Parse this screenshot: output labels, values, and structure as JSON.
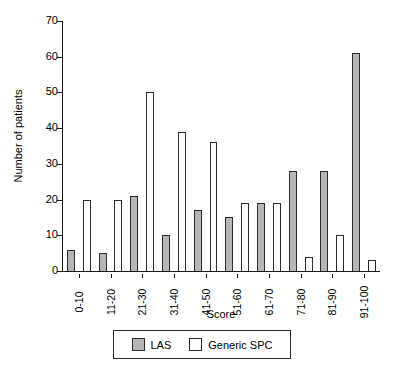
{
  "chart_data": {
    "type": "bar",
    "title": "",
    "xlabel": "Score",
    "ylabel": "Number of patients",
    "categories": [
      "0-10",
      "11-20",
      "21-30",
      "31-40",
      "41-50",
      "51-60",
      "61-70",
      "71-80",
      "81-90",
      "91-100"
    ],
    "series": [
      {
        "name": "LAS",
        "color": "#b5b5b5",
        "values": [
          6,
          5,
          21,
          10,
          17,
          15,
          19,
          28,
          28,
          61
        ]
      },
      {
        "name": "Generic SPC",
        "color": "#ffffff",
        "values": [
          20,
          20,
          50,
          39,
          36,
          19,
          19,
          4,
          10,
          3
        ]
      }
    ],
    "ylim": [
      0,
      70
    ],
    "yticks": [
      0,
      10,
      20,
      30,
      40,
      50,
      60,
      70
    ],
    "ytick_labels": [
      "0",
      "10",
      "20",
      "30",
      "40",
      "50",
      "60",
      "70"
    ],
    "grid": false,
    "legend_position": "bottom-center"
  },
  "legend": {
    "items": [
      {
        "label": "LAS",
        "swatch": "gray-filled-square"
      },
      {
        "label": "Generic SPC",
        "swatch": "white-open-square"
      }
    ]
  }
}
